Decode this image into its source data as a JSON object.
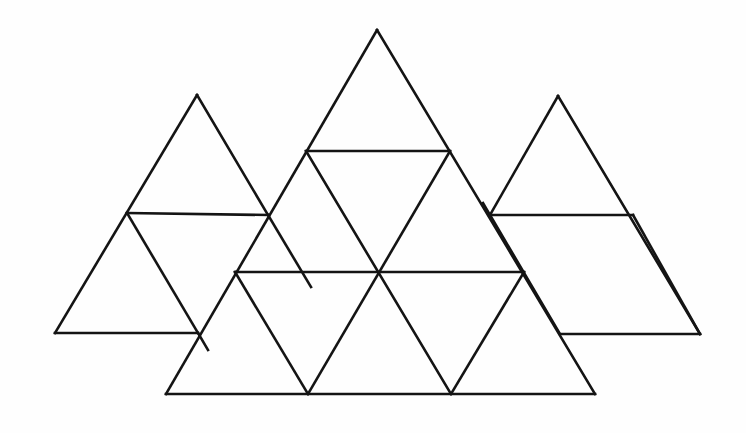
{
  "figure": {
    "title": "Overlapping triangular grid figure",
    "background_color": "#fefefe",
    "line_color": "#141414",
    "line_width_px": 2.6,
    "canvas": {
      "width": 746,
      "height": 433
    },
    "shape_count": 3,
    "shapes": [
      {
        "id": "left-triangle",
        "name": "left-triangle",
        "label": "Left triangle",
        "apex": [
          197,
          95
        ],
        "bottom_left": [
          55,
          333
        ],
        "bottom_right": [
          198,
          333
        ],
        "outline": "197,95 55,333 198,333",
        "subdivision_lines": [
          {
            "name": "left-horizontal-divider",
            "from": [
              127,
              213
            ],
            "to": [
              268,
              213
            ]
          },
          {
            "name": "left-inner-right-edge",
            "from": [
              127,
              213
            ],
            "to": [
              198,
              333
            ]
          }
        ]
      },
      {
        "id": "center-triangle",
        "name": "center-triangle",
        "label": "Center triangle",
        "apex": [
          377,
          30
        ],
        "bottom_left": [
          166,
          394
        ],
        "bottom_right": [
          595,
          394
        ],
        "outline": "377,30 166,394 595,394",
        "subdivision_lines": [
          {
            "name": "center-upper-horizontal",
            "from": [
              306,
              151
            ],
            "to": [
              450,
              151
            ]
          },
          {
            "name": "center-middle-horizontal",
            "from": [
              235,
              272
            ],
            "to": [
              524,
              272
            ]
          },
          {
            "name": "center-left-diagonal-down",
            "from": [
              306,
              151
            ],
            "to": [
              451,
              394
            ]
          },
          {
            "name": "center-right-diagonal-down",
            "from": [
              450,
              151
            ],
            "to": [
              308,
              394
            ]
          },
          {
            "name": "center-lower-left-diagonal",
            "from": [
              235,
              272
            ],
            "to": [
              308,
              394
            ]
          },
          {
            "name": "center-lower-right-diagonal",
            "from": [
              524,
              272
            ],
            "to": [
              451,
              394
            ]
          }
        ]
      },
      {
        "id": "right-triangle",
        "name": "right-triangle",
        "label": "Right triangle",
        "apex": [
          558,
          96
        ],
        "bottom_left": [
          560,
          334
        ],
        "bottom_right": [
          700,
          334
        ],
        "outline": "558,96 490,215 560,334 700,334",
        "subdivision_lines": [
          {
            "name": "right-horizontal-divider",
            "from": [
              490,
              215
            ],
            "to": [
              632,
              215
            ]
          },
          {
            "name": "right-inner-left-edge",
            "from": [
              632,
              215
            ],
            "to": [
              700,
              334
            ]
          }
        ]
      }
    ],
    "geometry_notes": {
      "small_triangle_count_center": 9,
      "orientation": "upright equilateral triangles",
      "overlap": "side triangles are partially occluded by the center triangle"
    }
  }
}
